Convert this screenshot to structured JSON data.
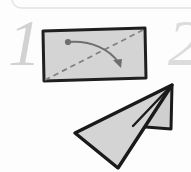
{
  "figure": {
    "kind": "origami-instruction-step",
    "background_color": "#fdfdfd",
    "panel": {
      "border_color": "#e2e2e2",
      "corner_radius": 9
    },
    "step_numbers": [
      {
        "label": "1",
        "color": "#d2d2d2",
        "position": "left"
      },
      {
        "label": "2",
        "color": "#dcdcdc",
        "position": "right-cropped"
      }
    ],
    "paper_sheet": {
      "name": "rectangular-paper",
      "fill_color": "#d4d4d4",
      "outline_color": "#1f1f1f",
      "outline_width": 3
    },
    "fold_line": {
      "name": "diagonal-fold-crease",
      "style": "dashed",
      "color": "#7a7a7a",
      "from": "bottom-left-corner",
      "to": "top-right-corner"
    },
    "fold_arrow": {
      "name": "fold-direction-arrow",
      "color": "#6e6e6e",
      "start_marker": "dot",
      "end_marker": "arrowhead",
      "direction": "down-right"
    },
    "folded_result": {
      "name": "folded-triangle-paper",
      "fill_color": "#d4d4d4",
      "outline_color": "#1a1a1a",
      "outline_width": 3,
      "flap_fill_color": "#cfcfcf"
    }
  }
}
